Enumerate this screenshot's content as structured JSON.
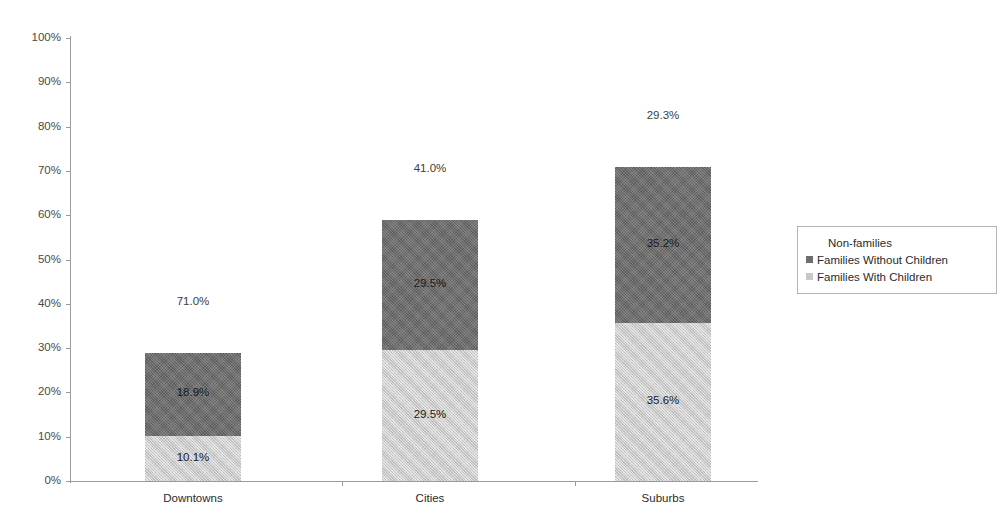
{
  "chart_data": {
    "type": "bar",
    "subtype": "stacked-bar",
    "title": "",
    "subtitle": "",
    "xlabel": "",
    "ylabel": "",
    "ylim": [
      0,
      100
    ],
    "yticks": [
      "0%",
      "10%",
      "20%",
      "30%",
      "40%",
      "50%",
      "60%",
      "70%",
      "80%",
      "90%",
      "100%"
    ],
    "ytick_values": [
      0,
      10,
      20,
      30,
      40,
      50,
      60,
      70,
      80,
      90,
      100
    ],
    "grid": false,
    "legend_position": "right",
    "categories": [
      "Downtowns",
      "Cities",
      "Suburbs"
    ],
    "series": [
      {
        "name": "Families With Children",
        "color": "#c8c8c8",
        "values": [
          10.1,
          29.5,
          35.6
        ],
        "labels": [
          "10.1%",
          "29.5%",
          "35.6%"
        ]
      },
      {
        "name": "Families Without Children",
        "color": "#6e6e6e",
        "values": [
          18.9,
          29.5,
          35.2
        ],
        "labels": [
          "18.9%",
          "29.5%",
          "35.2%"
        ]
      },
      {
        "name": "Non-families",
        "color": "#ffffff",
        "values": [
          71.0,
          41.0,
          29.3
        ],
        "labels": [
          "71.0%",
          "41.0%",
          "29.3%"
        ],
        "rendered": "label-only-above-bar"
      }
    ],
    "bar_totals": [
      29.0,
      59.0,
      70.8
    ],
    "annotations": [
      {
        "text": "71.0%",
        "category": "Downtowns",
        "position": "above-bar"
      },
      {
        "text": "41.0%",
        "category": "Cities",
        "position": "above-bar"
      },
      {
        "text": "29.3%",
        "category": "Suburbs",
        "position": "above-bar"
      }
    ]
  },
  "axis": {
    "y_ticks": [
      {
        "label": "100%",
        "value": 100
      },
      {
        "label": "90%",
        "value": 90
      },
      {
        "label": "80%",
        "value": 80
      },
      {
        "label": "70%",
        "value": 70
      },
      {
        "label": "60%",
        "value": 60
      },
      {
        "label": "50%",
        "value": 50
      },
      {
        "label": "40%",
        "value": 40
      },
      {
        "label": "30%",
        "value": 30
      },
      {
        "label": "20%",
        "value": 20
      },
      {
        "label": "10%",
        "value": 10
      },
      {
        "label": "0%",
        "value": 0
      }
    ]
  },
  "bars": [
    {
      "category": "Downtowns",
      "lower_label": "10.1%",
      "lower_value": 10.1,
      "upper_label": "18.9%",
      "upper_value": 18.9,
      "top_label": "71.0%"
    },
    {
      "category": "Cities",
      "lower_label": "29.5%",
      "lower_value": 29.5,
      "upper_label": "29.5%",
      "upper_value": 29.5,
      "top_label": "41.0%"
    },
    {
      "category": "Suburbs",
      "lower_label": "35.6%",
      "lower_value": 35.6,
      "upper_label": "35.2%",
      "upper_value": 35.2,
      "top_label": "29.3%"
    }
  ],
  "legend": {
    "items": [
      {
        "label": "Non-families",
        "swatch": "blank"
      },
      {
        "label": "Families Without Children",
        "swatch": "dark"
      },
      {
        "label": "Families With Children",
        "swatch": "light"
      }
    ]
  },
  "colors": {
    "families_with_children": "#c8c8c8",
    "families_without_children": "#6e6e6e",
    "non_families": "#ffffff",
    "axis": "#9a9a9a",
    "text": "#2b2b2b"
  }
}
